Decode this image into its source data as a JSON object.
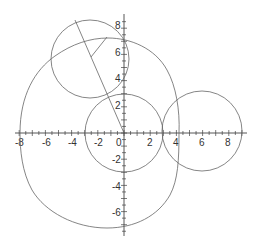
{
  "diagram": {
    "type": "geometric-construction",
    "axes": {
      "x_ticks": [
        "-8",
        "-6",
        "-4",
        "-2",
        "0",
        "2",
        "4",
        "6",
        "8"
      ],
      "y_ticks_positive": [
        "2",
        "4",
        "6",
        "8"
      ],
      "y_ticks_negative": [
        "-2",
        "-4",
        "-6"
      ],
      "x_range": [
        -8.3,
        9.4
      ],
      "y_range": [
        -7.9,
        9.0
      ]
    },
    "shapes": {
      "circle_center": {
        "cx": 0,
        "cy": 0,
        "r": 3
      },
      "circle_right": {
        "cx": 6,
        "cy": 0,
        "r": 3
      },
      "circle_top_left": {
        "cx": -2.6,
        "cy": 5.7,
        "r": 3
      },
      "big_curve": "closed curve through (-8,0), (-5.6,5.5), (0,7), (4,3.3), (4.2,0), (3.8,-4.4), (-1.3,-7.3)",
      "long_line": {
        "from": [
          -3.7,
          8.6
        ],
        "to": [
          0,
          0
        ]
      },
      "short_segment": {
        "from": [
          -1.3,
          7.3
        ],
        "to": [
          -2.5,
          5.8
        ]
      }
    },
    "colors": {
      "stroke": "#666666",
      "axis": "#444444",
      "background": "#ffffff"
    }
  }
}
